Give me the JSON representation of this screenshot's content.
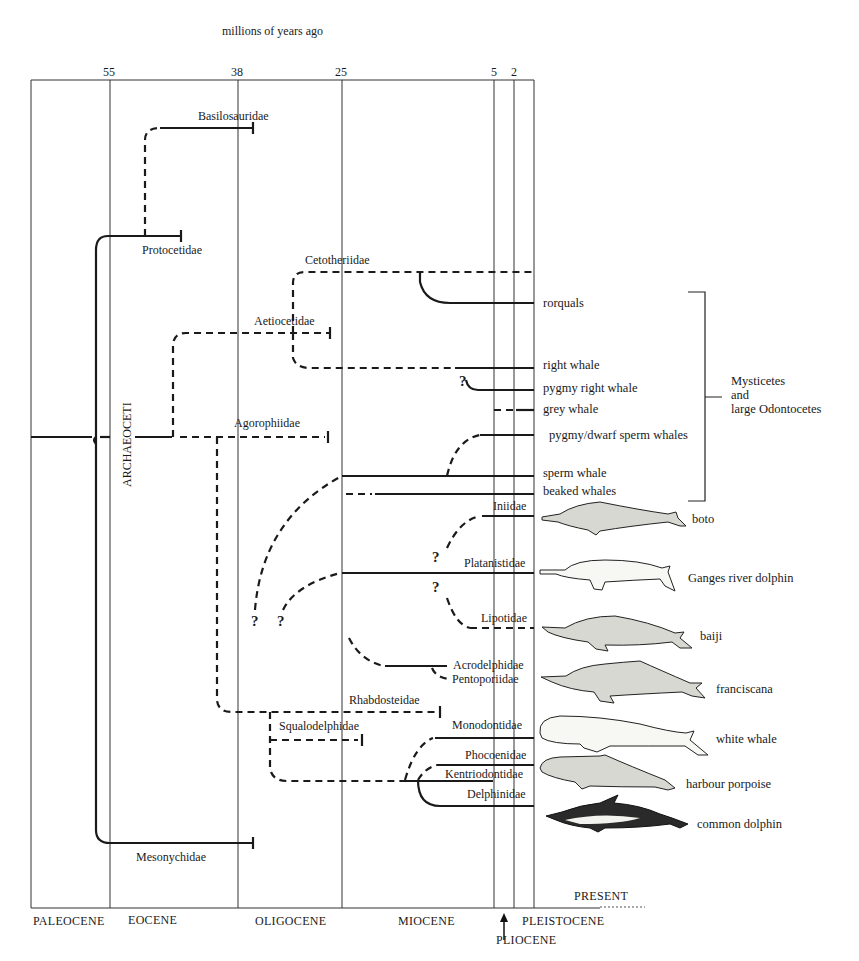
{
  "axis": {
    "title": "millions of years ago",
    "ticks": [
      {
        "label": "55",
        "x": 110
      },
      {
        "label": "38",
        "x": 238
      },
      {
        "label": "25",
        "x": 342
      },
      {
        "label": "5",
        "x": 494
      },
      {
        "label": "2",
        "x": 514
      }
    ],
    "present_label": "PRESENT"
  },
  "epochs": {
    "paleocene": "PALEOCENE",
    "eocene": "EOCENE",
    "oligocene": "OLIGOCENE",
    "miocene": "MIOCENE",
    "pliocene": "PLIOCENE",
    "pleistocene": "PLEISTOCENE"
  },
  "group_labels": {
    "archaeoceti": "ARCHAEOCETI",
    "mysticetes_line1": "Mysticetes",
    "mysticetes_line2": "and",
    "mysticetes_line3": "large Odontocetes"
  },
  "families": {
    "basilosauridae": "Basilosauridae",
    "protocetidae": "Protocetidae",
    "cetotheriidae": "Cetotheriidae",
    "aetiocetidae": "Aetiocetidae",
    "agorophiidae": "Agorophiidae",
    "iniidae": "Iniidae",
    "platanistidae": "Platanistidae",
    "lipotidae": "Lipotidae",
    "acrodelphidae": "Acrodelphidae",
    "pentoporiidae": "Pentoporiidae",
    "rhabdosteidae": "Rhabdosteidae",
    "squalodelphidae": "Squalodelphidae",
    "monodontidae": "Monodontidae",
    "phocoenidae": "Phocoenidae",
    "kentriodontidae": "Kentriodontidae",
    "delphinidae": "Delphinidae",
    "mesonychidae": "Mesonychidae"
  },
  "living_groups": {
    "rorquals": "rorquals",
    "right_whale": "right whale",
    "pygmy_right_whale": "pygmy right whale",
    "grey_whale": "grey whale",
    "pygmy_dwarf_sperm": "pygmy/dwarf sperm whales",
    "sperm_whale": "sperm whale",
    "beaked_whales": "beaked whales"
  },
  "illustrated_species": {
    "boto": "boto",
    "ganges": "Ganges river dolphin",
    "baiji": "baiji",
    "franciscana": "franciscana",
    "white_whale": "white whale",
    "harbour_porpoise": "harbour porpoise",
    "common_dolphin": "common dolphin"
  },
  "uncertain_mark": "?"
}
